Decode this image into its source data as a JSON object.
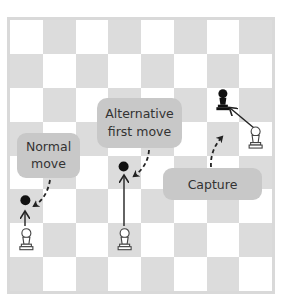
{
  "board": {
    "rows": 8,
    "cols": 8,
    "light_color": "#ffffff",
    "dark_color": "#dcdcdc",
    "frame_color": "#d9d9d9"
  },
  "pieces": [
    {
      "type": "white-pawn",
      "col": 0,
      "row": 6
    },
    {
      "type": "white-pawn",
      "col": 3,
      "row": 6
    },
    {
      "type": "white-pawn",
      "col": 7,
      "row": 3
    },
    {
      "type": "black-pawn",
      "col": 6,
      "row": 2
    }
  ],
  "targets": [
    {
      "col": 0,
      "row": 5
    },
    {
      "col": 3,
      "row": 4
    }
  ],
  "callouts": {
    "normal": {
      "line1": "Normal",
      "line2": "move"
    },
    "alternative": {
      "line1": "Alternative",
      "line2": "first move"
    },
    "capture": {
      "line1": "Capture"
    }
  },
  "colors": {
    "callout_bg": "#c8c8c8",
    "text": "#333333",
    "arrow": "#222222"
  }
}
